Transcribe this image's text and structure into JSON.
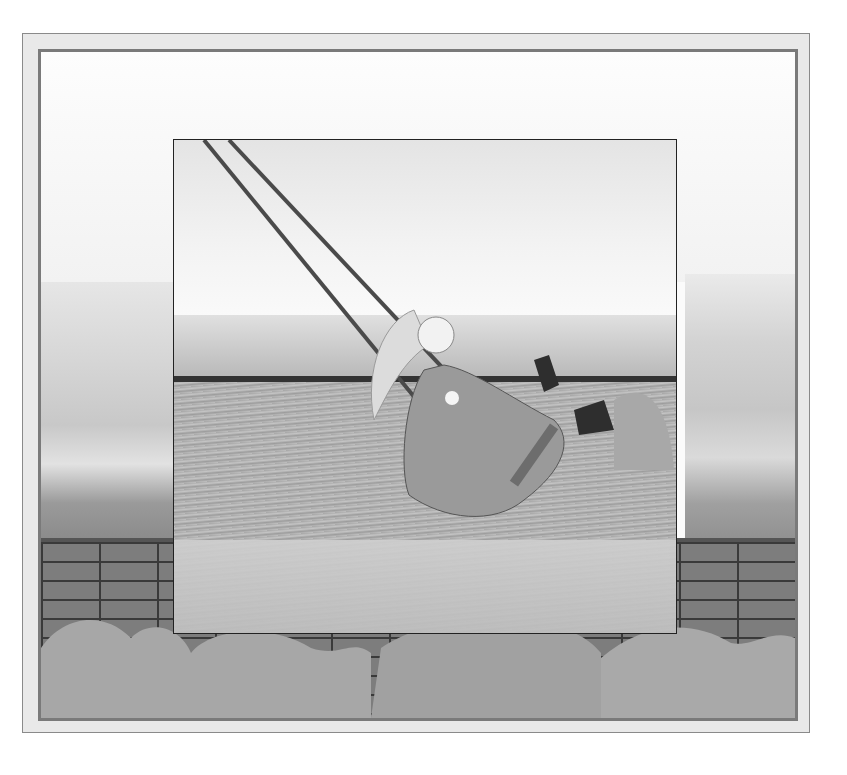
{
  "image": {
    "alt": "Pencil illustration of a child with long hair in a billowing dress and boots swinging on a rope swing over a grassy field, framed inside a stone-wall border with countryside hills and bushes",
    "palette": {
      "paper": "#ffffff",
      "frame_outer": "#e9e9e9",
      "frame_line": "#7a7a7a",
      "stone": "#7d7d7d",
      "mortar": "#3a3a3a",
      "grass": "#b0b0b0",
      "dress": "#9a9a9a",
      "boots": "#2e2e2e"
    }
  }
}
